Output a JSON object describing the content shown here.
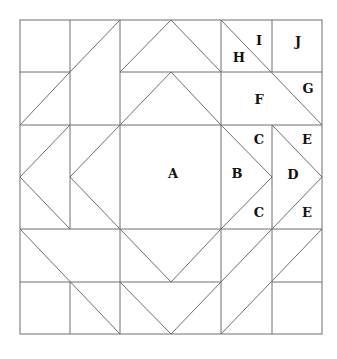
{
  "colors": {
    "line": "#6e6e6e",
    "label": "#111111",
    "background": "#ffffff"
  },
  "piece_labels": [
    {
      "id": "A",
      "text": "A"
    },
    {
      "id": "B",
      "text": "B"
    },
    {
      "id": "C1",
      "text": "C"
    },
    {
      "id": "C2",
      "text": "C"
    },
    {
      "id": "D",
      "text": "D"
    },
    {
      "id": "E1",
      "text": "E"
    },
    {
      "id": "E2",
      "text": "E"
    },
    {
      "id": "F",
      "text": "F"
    },
    {
      "id": "G",
      "text": "G"
    },
    {
      "id": "H",
      "text": "H"
    },
    {
      "id": "I",
      "text": "I"
    },
    {
      "id": "J",
      "text": "J"
    }
  ]
}
